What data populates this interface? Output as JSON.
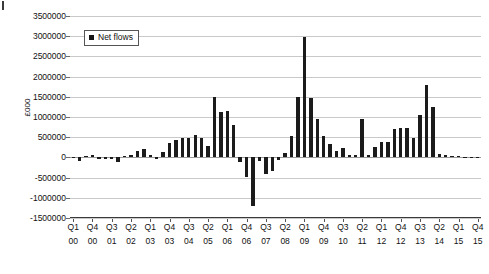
{
  "chart_data": {
    "type": "bar",
    "title": "",
    "xlabel": "",
    "ylabel": "£000",
    "ylim": [
      -1500000,
      3500000
    ],
    "ytick_step": 500000,
    "yticks": [
      3500000,
      3000000,
      2500000,
      2000000,
      1500000,
      1000000,
      500000,
      0,
      -500000,
      -1000000,
      -1500000
    ],
    "ytick_labels": [
      "3500000",
      "3000000",
      "2500000",
      "2000000",
      "1500000",
      "1000000",
      "500000",
      "0",
      "-500000",
      "-1000000",
      "-1500000"
    ],
    "grid": true,
    "legend": {
      "position": "top-left-inside",
      "entries": [
        {
          "label": "Net flows",
          "color": "#151515",
          "marker": "square"
        }
      ]
    },
    "xtick_labels": [
      {
        "quarter": "Q1",
        "year": "00"
      },
      {
        "quarter": "Q4",
        "year": "00"
      },
      {
        "quarter": "Q3",
        "year": "01"
      },
      {
        "quarter": "Q2",
        "year": "02"
      },
      {
        "quarter": "Q1",
        "year": "03"
      },
      {
        "quarter": "Q4",
        "year": "03"
      },
      {
        "quarter": "Q3",
        "year": "04"
      },
      {
        "quarter": "Q2",
        "year": "05"
      },
      {
        "quarter": "Q1",
        "year": "06"
      },
      {
        "quarter": "Q4",
        "year": "06"
      },
      {
        "quarter": "Q3",
        "year": "07"
      },
      {
        "quarter": "Q2",
        "year": "08"
      },
      {
        "quarter": "Q1",
        "year": "09"
      },
      {
        "quarter": "Q4",
        "year": "09"
      },
      {
        "quarter": "Q3",
        "year": "10"
      },
      {
        "quarter": "Q2",
        "year": "11"
      },
      {
        "quarter": "Q1",
        "year": "12"
      },
      {
        "quarter": "Q4",
        "year": "12"
      },
      {
        "quarter": "Q3",
        "year": "13"
      },
      {
        "quarter": "Q2",
        "year": "14"
      },
      {
        "quarter": "Q1",
        "year": "15"
      },
      {
        "quarter": "Q4",
        "year": "15"
      }
    ],
    "categories": [
      "Q1 00",
      "Q2 00",
      "Q3 00",
      "Q4 00",
      "Q1 01",
      "Q2 01",
      "Q3 01",
      "Q4 01",
      "Q1 02",
      "Q2 02",
      "Q3 02",
      "Q4 02",
      "Q1 03",
      "Q2 03",
      "Q3 03",
      "Q4 03",
      "Q1 04",
      "Q2 04",
      "Q3 04",
      "Q4 04",
      "Q1 05",
      "Q2 05",
      "Q3 05",
      "Q4 05",
      "Q1 06",
      "Q2 06",
      "Q3 06",
      "Q4 06",
      "Q1 07",
      "Q2 07",
      "Q3 07",
      "Q4 07",
      "Q1 08",
      "Q2 08",
      "Q3 08",
      "Q4 08",
      "Q1 09",
      "Q2 09",
      "Q3 09",
      "Q4 09",
      "Q1 10",
      "Q2 10",
      "Q3 10",
      "Q4 10",
      "Q1 11",
      "Q2 11",
      "Q3 11",
      "Q4 11",
      "Q1 12",
      "Q2 12",
      "Q3 12",
      "Q4 12",
      "Q1 13",
      "Q2 13",
      "Q3 13",
      "Q4 13",
      "Q1 14",
      "Q2 14",
      "Q3 14",
      "Q4 14",
      "Q1 15",
      "Q2 15",
      "Q3 15",
      "Q4 15"
    ],
    "series": [
      {
        "name": "Net flows",
        "color": "#1b1b1b",
        "values": [
          -20000,
          -90000,
          40000,
          60000,
          -30000,
          -40000,
          -50000,
          -110000,
          30000,
          50000,
          170000,
          210000,
          50000,
          -40000,
          130000,
          360000,
          430000,
          480000,
          480000,
          560000,
          470000,
          270000,
          1490000,
          1120000,
          1140000,
          790000,
          -120000,
          -480000,
          -1210000,
          -90000,
          -400000,
          -340000,
          -60000,
          110000,
          540000,
          1500000,
          2990000,
          1470000,
          960000,
          530000,
          330000,
          160000,
          240000,
          70000,
          50000,
          950000,
          60000,
          260000,
          380000,
          390000,
          700000,
          720000,
          720000,
          470000,
          1040000,
          1790000,
          1250000,
          80000,
          60000,
          40000,
          30000,
          20000,
          10000,
          5000
        ]
      }
    ]
  }
}
